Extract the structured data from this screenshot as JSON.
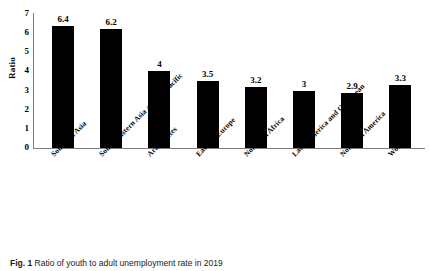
{
  "chart_data": {
    "type": "bar",
    "title": "",
    "xlabel": "",
    "ylabel": "Ratio",
    "ylim": [
      0,
      7
    ],
    "grid": false,
    "legend": "none",
    "bar_color": "#000000",
    "axis_color": "#7f7f7f",
    "background": "#ffffff",
    "y_ticks": [
      "7",
      "6",
      "5",
      "4",
      "3",
      "2",
      "1",
      "0"
    ],
    "y_tick_values": [
      7,
      6,
      5,
      4,
      3,
      2,
      1,
      0
    ],
    "categories": [
      "Southern Asia",
      "South-Eastern Asia and the Pacific",
      "Arab States",
      "Eastern Europe",
      "Northern Africa",
      "Latin America and Caribbean",
      "Northern America",
      "World"
    ],
    "values": [
      6.4,
      6.2,
      4,
      3.5,
      3.2,
      3,
      2.9,
      3.3
    ],
    "value_labels": [
      "6.4",
      "6.2",
      "4",
      "3.5",
      "3.2",
      "3",
      "2.9",
      "3.3"
    ]
  },
  "caption": {
    "label": "Fig. 1",
    "text": " Ratio of youth to adult unemployment rate in 2019"
  }
}
